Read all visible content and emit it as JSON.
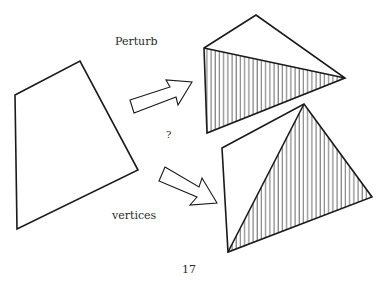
{
  "figure": {
    "labels": {
      "top": "Perturb",
      "middle": "?",
      "bottom": "vertices"
    },
    "page_number": "17",
    "colors": {
      "stroke": "#1a1a1a",
      "hatch": "#333333",
      "background": "#ffffff"
    },
    "shapes": {
      "original_quadrilateral": {
        "vertices": [
          [
            15,
            95
          ],
          [
            80,
            61
          ],
          [
            138,
            170
          ],
          [
            17,
            229
          ]
        ]
      },
      "top_triangulation": {
        "outline": [
          [
            204,
            48
          ],
          [
            256,
            15
          ],
          [
            345,
            78
          ],
          [
            207,
            133
          ]
        ],
        "hatched_triangle": [
          [
            204,
            48
          ],
          [
            345,
            78
          ],
          [
            207,
            133
          ]
        ],
        "diagonal": [
          [
            204,
            48
          ],
          [
            345,
            78
          ]
        ]
      },
      "bottom_triangulation": {
        "outline": [
          [
            222,
            148
          ],
          [
            304,
            104
          ],
          [
            372,
            197
          ],
          [
            228,
            252
          ]
        ],
        "hatched_triangle": [
          [
            304,
            104
          ],
          [
            372,
            197
          ],
          [
            228,
            252
          ]
        ],
        "diagonal": [
          [
            304,
            104
          ],
          [
            228,
            252
          ]
        ]
      },
      "arrows": [
        {
          "direction": "up-right",
          "target": "top_triangulation"
        },
        {
          "direction": "down-right",
          "target": "bottom_triangulation"
        }
      ]
    }
  }
}
